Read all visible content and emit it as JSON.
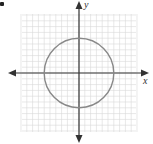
{
  "chart_data": {
    "type": "line",
    "title": "",
    "xlabel": "x",
    "ylabel": "y",
    "xlim": [
      -10,
      10
    ],
    "ylim": [
      -10,
      10
    ],
    "grid": true,
    "grid_step": 1,
    "series": [
      {
        "name": "circle",
        "shape": "circle",
        "center": [
          0,
          0
        ],
        "radius": 6,
        "equation": "x^2 + y^2 = 36",
        "color": "#888888"
      }
    ],
    "legend": null
  },
  "labels": {
    "x_axis": "x",
    "y_axis": "y"
  },
  "colors": {
    "grid": "#d9d9d9",
    "axes": "#333333",
    "curve": "#888888"
  },
  "layout": {
    "grid_left": 22,
    "grid_top": 14,
    "grid_right": 136,
    "grid_bottom": 132,
    "origin_x": 79,
    "origin_y": 73,
    "unit_px": 5.8
  }
}
